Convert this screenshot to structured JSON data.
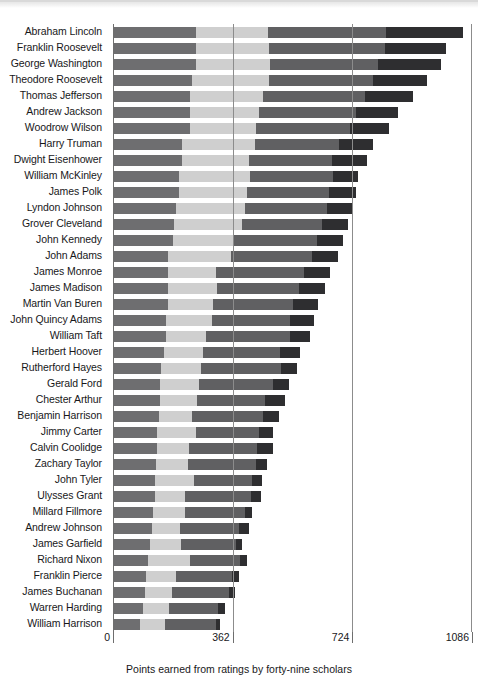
{
  "chart_data": {
    "type": "bar",
    "subtype": "stacked-horizontal-bar",
    "title": "",
    "xlabel": "Points earned from ratings by forty-nine scholars",
    "ylabel": "",
    "xlim": [
      0,
      1086
    ],
    "xticks": [
      0,
      362,
      724,
      1086
    ],
    "xticklabels": [
      "0",
      "362",
      "724",
      "1086"
    ],
    "grid": "vertical gridlines at 362 and 724",
    "legend": "none",
    "categories": [
      "Abraham Lincoln",
      "Franklin Roosevelt",
      "George Washington",
      "Theodore Roosevelt",
      "Thomas Jefferson",
      "Andrew Jackson",
      "Woodrow Wilson",
      "Harry Truman",
      "Dwight Eisenhower",
      "William McKinley",
      "James Polk",
      "Lyndon Johnson",
      "Grover Cleveland",
      "John Kennedy",
      "John Adams",
      "James Monroe",
      "James Madison",
      "Martin Van Buren",
      "John Quincy Adams",
      "William Taft",
      "Herbert Hoover",
      "Rutherford Hayes",
      "Gerald Ford",
      "Chester Arthur",
      "Benjamin Harrison",
      "Jimmy Carter",
      "Calvin Coolidge",
      "Zachary Taylor",
      "John Tyler",
      "Ulysses Grant",
      "Millard Fillmore",
      "Andrew Johnson",
      "James Garfield",
      "Richard Nixon",
      "Franklin Pierce",
      "James Buchanan",
      "Warren Harding",
      "William Harrison"
    ],
    "series": [
      {
        "name": "segment-1",
        "color": "#6e6e70",
        "values": [
          251,
          251,
          251,
          239,
          233,
          233,
          233,
          209,
          209,
          199,
          199,
          190,
          184,
          181,
          166,
          166,
          166,
          166,
          160,
          160,
          154,
          145,
          142,
          142,
          139,
          133,
          133,
          130,
          127,
          127,
          121,
          118,
          112,
          106,
          100,
          97,
          91,
          82
        ]
      },
      {
        "name": "segment-2",
        "color": "#cfcfcf",
        "values": [
          218,
          221,
          224,
          233,
          221,
          209,
          199,
          221,
          203,
          215,
          206,
          209,
          206,
          181,
          190,
          145,
          148,
          136,
          139,
          121,
          118,
          121,
          118,
          112,
          100,
          118,
          97,
          97,
          118,
          91,
          97,
          85,
          94,
          127,
          91,
          82,
          79,
          76
        ]
      },
      {
        "name": "segment-3",
        "color": "#606062",
        "values": [
          358,
          352,
          327,
          315,
          309,
          294,
          285,
          254,
          251,
          251,
          248,
          248,
          242,
          254,
          245,
          267,
          248,
          242,
          236,
          254,
          233,
          242,
          224,
          206,
          215,
          190,
          206,
          206,
          175,
          200,
          181,
          178,
          166,
          151,
          169,
          172,
          148,
          154
        ]
      },
      {
        "name": "segment-4",
        "color": "#2e2e30",
        "values": [
          233,
          184,
          190,
          163,
          145,
          127,
          118,
          103,
          106,
          76,
          82,
          76,
          79,
          79,
          79,
          79,
          79,
          76,
          73,
          61,
          61,
          48,
          48,
          61,
          48,
          42,
          48,
          33,
          30,
          30,
          21,
          30,
          18,
          21,
          21,
          18,
          21,
          12
        ]
      }
    ],
    "totals": [
      1060,
      1008,
      992,
      950,
      908,
      863,
      835,
      787,
      769,
      741,
      735,
      723,
      711,
      695,
      680,
      657,
      641,
      620,
      608,
      596,
      566,
      556,
      532,
      521,
      502,
      483,
      484,
      466,
      450,
      448,
      420,
      411,
      390,
      405,
      381,
      369,
      339,
      324
    ],
    "note": "Values estimated from bar pixel extents; x-axis scale 0-1086"
  },
  "axis": {
    "tick_0": "0",
    "tick_1": "362",
    "tick_2": "724",
    "tick_3": "1086"
  },
  "caption": {
    "text": "Points earned from ratings by forty-nine scholars"
  }
}
